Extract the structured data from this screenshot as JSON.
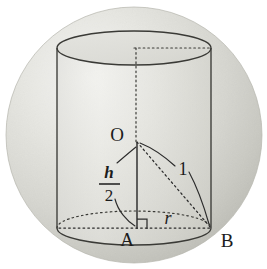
{
  "figure": {
    "background_color": "#ffffff",
    "ink_color": "#2b2b2b",
    "sphere": {
      "name": "sphere",
      "fill_light": "#f2f2ef",
      "fill_mid": "#d9d9d4",
      "fill_dark": "#c2c2bb",
      "center_x": 134,
      "center_y": 135,
      "radius": 128
    },
    "cylinder": {
      "name": "inscribed-cylinder",
      "left_x": 57,
      "right_x": 211,
      "top_y": 48,
      "bottom_y": 228,
      "ellipse_ry": 17,
      "stroke_color": "#3a3a36"
    },
    "labels": {
      "center_point": "O",
      "foot_point": "A",
      "rim_point": "B",
      "radius_label": "r",
      "slant_label": "1",
      "height_numerator": "h",
      "height_denominator": "2",
      "fraction_bar": "—"
    },
    "annotations": {
      "right_angle_marker": "right-angle-at-A",
      "axis_style": "dotted",
      "hypotenuse_style": "dotted",
      "base_radius_style": "dotted",
      "hidden_ellipse_style": "dotted",
      "visible_ellipse_style": "solid"
    }
  }
}
